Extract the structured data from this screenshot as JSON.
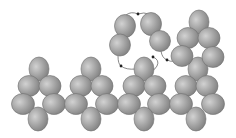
{
  "diagram": {
    "width": 236,
    "height": 138,
    "background": "#ffffff",
    "sphere_style": {
      "fill_light": "#d2d2d2",
      "fill_mid": "#a3a3a3",
      "fill_dark": "#7e7e7e",
      "stroke": "#6f6f6f"
    },
    "connector_color": "#6a6a6a",
    "clusters": [
      {
        "name": "cluster-1",
        "spheres": [
          {
            "cx": 39,
            "cy": 69,
            "rx": 10,
            "ry": 12
          },
          {
            "cx": 29,
            "cy": 86,
            "rx": 11,
            "ry": 10.5
          },
          {
            "cx": 50,
            "cy": 86,
            "rx": 11,
            "ry": 10.5
          },
          {
            "cx": 23,
            "cy": 104,
            "rx": 11.5,
            "ry": 10.5
          },
          {
            "cx": 54,
            "cy": 104,
            "rx": 11.5,
            "ry": 10.5
          },
          {
            "cx": 38,
            "cy": 119,
            "rx": 10,
            "ry": 12
          }
        ]
      },
      {
        "name": "cluster-2",
        "spheres": [
          {
            "cx": 91,
            "cy": 69,
            "rx": 10,
            "ry": 12
          },
          {
            "cx": 81,
            "cy": 86,
            "rx": 11,
            "ry": 10.5
          },
          {
            "cx": 102,
            "cy": 86,
            "rx": 11,
            "ry": 10.5
          },
          {
            "cx": 76,
            "cy": 104,
            "rx": 11.5,
            "ry": 10.5
          },
          {
            "cx": 107,
            "cy": 104,
            "rx": 11.5,
            "ry": 10.5
          },
          {
            "cx": 91,
            "cy": 119,
            "rx": 10,
            "ry": 12
          }
        ]
      },
      {
        "name": "cluster-3",
        "spheres": [
          {
            "cx": 144,
            "cy": 69,
            "rx": 10,
            "ry": 12
          },
          {
            "cx": 134,
            "cy": 86,
            "rx": 11,
            "ry": 10.5
          },
          {
            "cx": 155,
            "cy": 86,
            "rx": 11,
            "ry": 10.5
          },
          {
            "cx": 129,
            "cy": 104,
            "rx": 11.5,
            "ry": 10.5
          },
          {
            "cx": 159,
            "cy": 104,
            "rx": 11.5,
            "ry": 10.5
          },
          {
            "cx": 144,
            "cy": 119,
            "rx": 10,
            "ry": 12
          }
        ]
      },
      {
        "name": "cluster-4",
        "spheres": [
          {
            "cx": 198,
            "cy": 69,
            "rx": 10,
            "ry": 12
          },
          {
            "cx": 186,
            "cy": 86,
            "rx": 11,
            "ry": 10.5
          },
          {
            "cx": 207,
            "cy": 86,
            "rx": 11,
            "ry": 10.5
          },
          {
            "cx": 181,
            "cy": 104,
            "rx": 11.5,
            "ry": 10.5
          },
          {
            "cx": 213,
            "cy": 104,
            "rx": 11.5,
            "ry": 10.5
          },
          {
            "cx": 196,
            "cy": 119,
            "rx": 10,
            "ry": 12
          }
        ]
      },
      {
        "name": "cluster-upper-right",
        "spheres": [
          {
            "cx": 199,
            "cy": 22,
            "rx": 10,
            "ry": 12
          },
          {
            "cx": 188,
            "cy": 38,
            "rx": 11,
            "ry": 10.5
          },
          {
            "cx": 209,
            "cy": 38,
            "rx": 11,
            "ry": 10.5
          },
          {
            "cx": 182,
            "cy": 56,
            "rx": 11,
            "ry": 10.5
          },
          {
            "cx": 213,
            "cy": 57,
            "rx": 11,
            "ry": 10.5
          }
        ]
      },
      {
        "name": "floating-pair-left",
        "spheres": [
          {
            "cx": 125,
            "cy": 26,
            "rx": 10.5,
            "ry": 11.5
          },
          {
            "cx": 120,
            "cy": 45,
            "rx": 10.5,
            "ry": 11
          }
        ]
      },
      {
        "name": "floating-pair-right",
        "spheres": [
          {
            "cx": 151,
            "cy": 24,
            "rx": 10.5,
            "ry": 11.5
          },
          {
            "cx": 160,
            "cy": 41,
            "rx": 10.5,
            "ry": 10.5
          }
        ]
      }
    ],
    "connectors": [
      {
        "name": "arc-top",
        "d": "M 126 15 Q 131 11 138 14 Q 144 12 149 14",
        "arrow_at": {
          "x": 138,
          "y": 14
        }
      },
      {
        "name": "left-link",
        "d": "M 118 56 Q 118 64 121 66 Q 126 70 136 69",
        "arrow_at": {
          "x": 121,
          "y": 66
        }
      },
      {
        "name": "mid-hook",
        "d": "M 153 57 Q 160 60 157 66 Q 155 70 151 71",
        "arrow_at": {
          "x": 153,
          "y": 57
        }
      },
      {
        "name": "right-link",
        "d": "M 161 51 Q 162 58 167 60 Q 171 62 174 61",
        "arrow_at": {
          "x": 167,
          "y": 60
        }
      }
    ]
  }
}
